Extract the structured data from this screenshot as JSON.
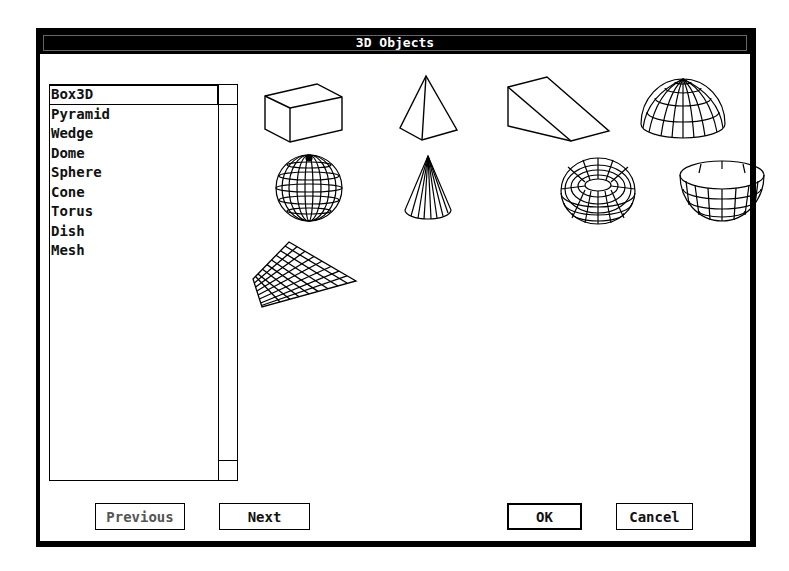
{
  "dialog": {
    "title": "3D Objects"
  },
  "list": {
    "items": [
      {
        "label": "Box3D",
        "selected": true
      },
      {
        "label": "Pyramid"
      },
      {
        "label": "Wedge"
      },
      {
        "label": "Dome"
      },
      {
        "label": "Sphere"
      },
      {
        "label": "Cone"
      },
      {
        "label": "Torus"
      },
      {
        "label": "Dish"
      },
      {
        "label": "Mesh"
      }
    ]
  },
  "objects": [
    {
      "name": "box3d",
      "icon": "box3d-icon"
    },
    {
      "name": "pyramid",
      "icon": "pyramid-icon"
    },
    {
      "name": "wedge",
      "icon": "wedge-icon"
    },
    {
      "name": "dome",
      "icon": "dome-icon"
    },
    {
      "name": "sphere",
      "icon": "sphere-icon"
    },
    {
      "name": "cone",
      "icon": "cone-icon"
    },
    {
      "name": "torus",
      "icon": "torus-icon"
    },
    {
      "name": "dish",
      "icon": "dish-icon"
    },
    {
      "name": "mesh",
      "icon": "mesh-icon"
    }
  ],
  "buttons": {
    "previous": "Previous",
    "next": "Next",
    "ok": "OK",
    "cancel": "Cancel"
  },
  "colors": {
    "title_bg": "#000000",
    "title_fg": "#ffffff",
    "background": "#ffffff",
    "line": "#000000"
  }
}
